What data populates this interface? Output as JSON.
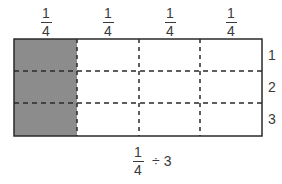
{
  "diagram": {
    "column_labels": [
      {
        "numerator": "1",
        "denominator": "4"
      },
      {
        "numerator": "1",
        "denominator": "4"
      },
      {
        "numerator": "1",
        "denominator": "4"
      },
      {
        "numerator": "1",
        "denominator": "4"
      }
    ],
    "row_labels": [
      "1",
      "2",
      "3"
    ],
    "shaded_column_index": 0,
    "shade_color": "#8c8c8c",
    "line_color": "#2a2a2a",
    "expression": {
      "numerator": "1",
      "denominator": "4",
      "operator": "÷",
      "operand": "3"
    }
  }
}
